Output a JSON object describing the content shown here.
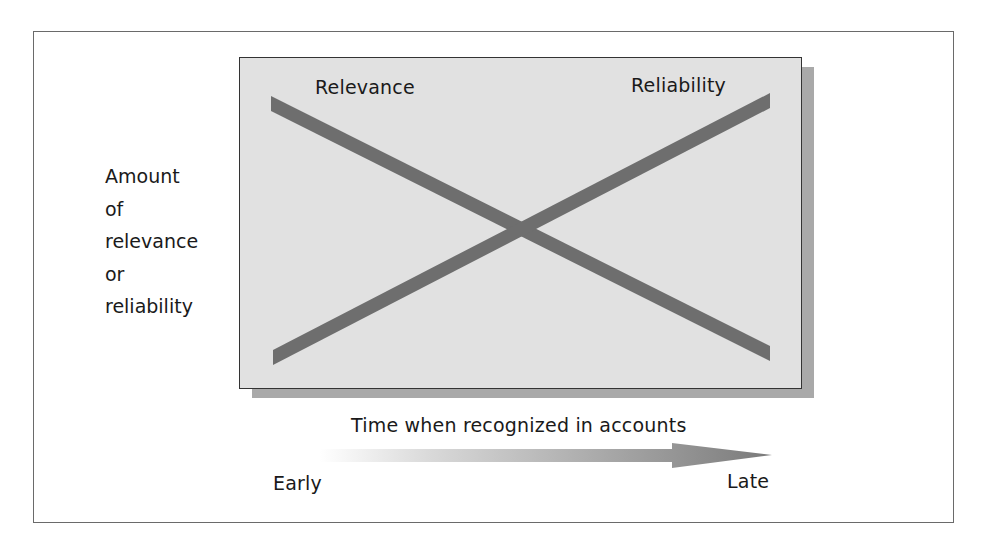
{
  "diagram": {
    "y_axis_label": [
      "Amount",
      "of",
      "relevance",
      "or",
      "reliability"
    ],
    "lines": [
      {
        "label": "Relevance",
        "direction": "decreasing",
        "start": "high-left",
        "end": "low-right"
      },
      {
        "label": "Reliability",
        "direction": "increasing",
        "start": "low-left",
        "end": "high-right"
      }
    ],
    "x_axis": {
      "title": "Time when recognized in accounts",
      "start_label": "Early",
      "end_label": "Late"
    },
    "colors": {
      "box_fill": "#e1e1e1",
      "bar": "#6e6e6e",
      "shadow": "#a9a9a9",
      "arrow": "#7a7a7a"
    }
  }
}
